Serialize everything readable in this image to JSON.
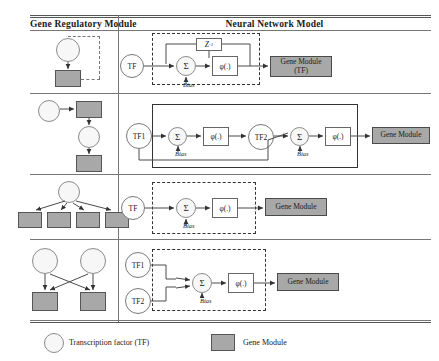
{
  "table": {
    "headers": {
      "left": "Gene Regulatory Module",
      "right": "Neural Network Model"
    }
  },
  "rows": [
    {
      "id": "row-1",
      "nn": {
        "tf_labels": [
          "TF"
        ],
        "sum_symbol": "Σ",
        "activation": "φ(.)",
        "bias": "Bias",
        "delay": "Z",
        "delay_exponent": "-1",
        "output": "Gene Module",
        "output_sub": "(TF)",
        "border_style": "dashed"
      }
    },
    {
      "id": "row-2",
      "nn": {
        "tf_labels": [
          "TF1",
          "TF2"
        ],
        "sum_symbol": "Σ",
        "activation": "φ(.)",
        "bias": "Bias",
        "output": "Gene Module",
        "border_style": "solid"
      }
    },
    {
      "id": "row-3",
      "nn": {
        "tf_labels": [
          "TF"
        ],
        "sum_symbol": "Σ",
        "activation": "φ(.)",
        "bias": "Bias",
        "output": "Gene Module",
        "border_style": "dashed"
      }
    },
    {
      "id": "row-4",
      "nn": {
        "tf_labels": [
          "TF1",
          "TF2"
        ],
        "sum_symbol": "Σ",
        "activation": "φ(.)",
        "bias": "Bias",
        "output": "Gene Module",
        "border_style": "dashed"
      }
    }
  ],
  "legend": {
    "items": [
      {
        "shape": "circle",
        "label": "Transcription factor (TF)"
      },
      {
        "shape": "square",
        "label": "Gene Module"
      }
    ]
  },
  "colors": {
    "module_fill": "#a8a8a8",
    "node_fill": "#f7f7f7",
    "stroke": "#4a4a4a",
    "rule": "#555555"
  }
}
